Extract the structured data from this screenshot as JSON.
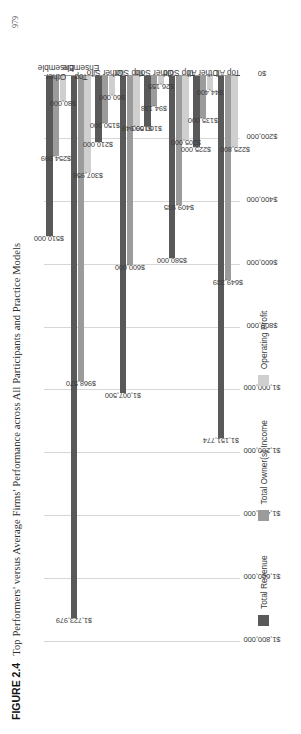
{
  "figure": {
    "number": "FIGURE 2.4",
    "caption": "Top Performers' versus Average Firms' Performance across All Participants and Practice Models",
    "folio": "979"
  },
  "chart_data": {
    "type": "bar",
    "orientation": "horizontal",
    "title": "Top Performers' versus Average Firms' Performance across All Participants and Practice Models",
    "xlabel": "",
    "ylabel": "",
    "xlim": [
      0,
      1800000
    ],
    "grid": true,
    "legend_position": "bottom",
    "tick_labels": [
      "$1,800,000",
      "$1,600,000",
      "$1,400,000",
      "$1,200,000",
      "$1,000,000",
      "$800,000",
      "$600,000",
      "$400,000",
      "$200,000",
      "$0"
    ],
    "tick_values": [
      1800000,
      1600000,
      1400000,
      1200000,
      1000000,
      800000,
      600000,
      400000,
      200000,
      0
    ],
    "categories": [
      "Top All",
      "Other All",
      "Top Solo",
      "Other Solo",
      "Top Silo",
      "Other Silo",
      "Top\nEnsemble",
      "Other\nEnsemble"
    ],
    "series": [
      {
        "name": "Total Revenue",
        "color": "#595959",
        "values": [
          1151774,
          225000,
          580000,
          160000,
          1007500,
          210000,
          1723979,
          510000
        ],
        "labels": [
          "$1,151,774",
          "$225,000",
          "$580,000",
          "$160,000",
          "$1,007,500",
          "$210,000",
          "$1,723,979",
          "$510,000"
        ]
      },
      {
        "name": "Total Owner(s) Income",
        "color": "#9b9b9b",
        "values": [
          649339,
          135000,
          409935,
          94138,
          600000,
          150000,
          968570,
          254999
        ],
        "labels": [
          "$649,339",
          "$135,000",
          "$409,935",
          "$94,138",
          "$600,000",
          "$150,000",
          "$968,570",
          "$254,999"
        ]
      },
      {
        "name": "Operating Profit",
        "color": "#cfcfcf",
        "values": [
          225800,
          44400,
          205000,
          26155,
          159949,
          60000,
          307958,
          80000
        ],
        "labels": [
          "$225,800",
          "$44,400",
          "$205,000",
          "$26,155",
          "$159,949",
          "$60,000",
          "$307,958",
          "$80,000"
        ]
      }
    ]
  }
}
